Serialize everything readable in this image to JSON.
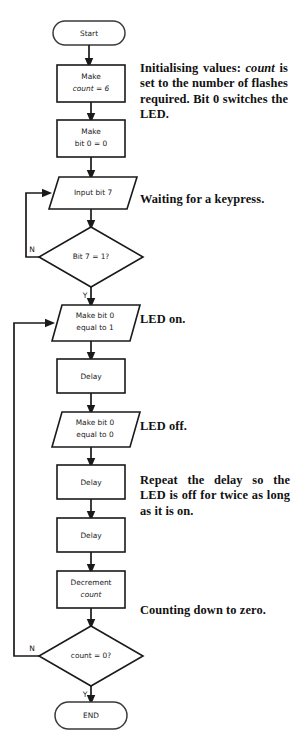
{
  "diagram": {
    "type": "flowchart",
    "nodes": [
      {
        "id": "start",
        "shape": "terminator",
        "label": "Start"
      },
      {
        "id": "count6",
        "shape": "process",
        "line1": "Make",
        "line2": "count = 6",
        "italic_part": "count"
      },
      {
        "id": "bit0",
        "shape": "process",
        "line1": "Make",
        "line2": "bit 0 = 0"
      },
      {
        "id": "inputbit7",
        "shape": "input-output",
        "label": "Input bit 7"
      },
      {
        "id": "bit7test",
        "shape": "decision",
        "label": "Bit 7 = 1?",
        "no_label": "N",
        "yes_label": "Y"
      },
      {
        "id": "ledon",
        "shape": "input-output",
        "line1": "Make bit 0",
        "line2": "equal to 1"
      },
      {
        "id": "delay1",
        "shape": "process",
        "label": "Delay"
      },
      {
        "id": "ledoff",
        "shape": "input-output",
        "line1": "Make bit 0",
        "line2": "equal to 0"
      },
      {
        "id": "delay2",
        "shape": "process",
        "label": "Delay"
      },
      {
        "id": "delay3",
        "shape": "process",
        "label": "Delay"
      },
      {
        "id": "decrement",
        "shape": "process",
        "line1": "Decrement",
        "line2": "count",
        "italic_part": "count"
      },
      {
        "id": "counttest",
        "shape": "decision",
        "label": "count = 0?",
        "no_label": "N",
        "yes_label": "Y"
      },
      {
        "id": "end",
        "shape": "terminator",
        "label": "END"
      }
    ]
  },
  "annotations": [
    {
      "id": "init-note",
      "lines": [
        "Initialising values:",
        "count is set to the",
        "number of flashes",
        "required. Bit 0",
        "switches the LED."
      ],
      "text": "Initialising values: count is set to the number of flashes required. Bit 0 switches the LED."
    },
    {
      "id": "wait-note",
      "lines": [
        "Waiting for a",
        "keypress."
      ],
      "text": "Waiting for a keypress."
    },
    {
      "id": "ledon-note",
      "lines": [
        "LED on."
      ],
      "text": "LED on."
    },
    {
      "id": "ledoff-note",
      "lines": [
        "LED off."
      ],
      "text": "LED off."
    },
    {
      "id": "repeat-note",
      "lines": [
        "Repeat the delay so",
        "the LED is off for twice",
        "as long as  it is on."
      ],
      "text": "Repeat the delay so the LED is off for twice as long as it is on."
    },
    {
      "id": "counting-note",
      "lines": [
        "Counting down to",
        "zero."
      ],
      "text": "Counting down to zero."
    }
  ],
  "labels": {
    "start": "Start",
    "make": "Make",
    "count_eq_6": "count = 6",
    "bit0_eq_0": "bit 0 = 0",
    "input_bit_7": "Input bit 7",
    "bit7_test": "Bit 7 = 1?",
    "make_bit0": "Make bit 0",
    "equal_to_1": "equal to 1",
    "equal_to_0": "equal to 0",
    "delay": "Delay",
    "decrement": "Decrement",
    "count": "count",
    "count_test": "count = 0?",
    "yes": "Y",
    "no": "N",
    "end": "END"
  },
  "annotation_text": {
    "init_1": "Initialising",
    "init_2": "values:",
    "init_3": "count",
    "init_4": "is set to the",
    "init_5": "number",
    "init_6": "of",
    "init_7": "flashes",
    "init_8": "required.",
    "init_9": "Bit",
    "init_10": "0",
    "init_11": "switches the LED.",
    "wait_1": "Waiting",
    "wait_2": "for",
    "wait_3": "a",
    "wait_4": "keypress.",
    "led_on": "LED on.",
    "led_off": "LED off.",
    "repeat_1": "Repeat the delay so",
    "repeat_2": "the LED is off for twice",
    "repeat_3": "as long as  it is on.",
    "count_1": "Counting",
    "count_2": "down",
    "count_3": "to",
    "count_4": "zero."
  },
  "colors": {
    "stroke": "#1a1a1a",
    "fill": "#ffffff",
    "text": "#111111",
    "background": "#ffffff"
  }
}
